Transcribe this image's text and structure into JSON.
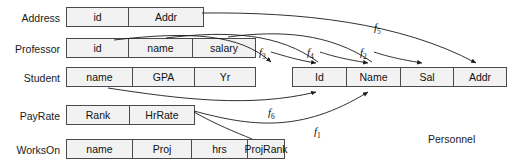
{
  "diagram": {
    "title_caption": "Personnel",
    "source_tables": [
      {
        "name": "Address",
        "label_x": 4,
        "label_y": 13,
        "box_x": 66,
        "box_y": 7,
        "attributes": [
          {
            "name": "id",
            "width": 62
          },
          {
            "name": "Addr",
            "width": 74
          }
        ]
      },
      {
        "name": "Professor",
        "label_x": 4,
        "label_y": 44,
        "box_x": 66,
        "box_y": 38,
        "attributes": [
          {
            "name": "id",
            "width": 62
          },
          {
            "name": "name",
            "width": 64
          },
          {
            "name": "salary",
            "width": 62
          }
        ]
      },
      {
        "name": "Student",
        "label_x": 4,
        "label_y": 73,
        "box_x": 66,
        "box_y": 67,
        "attributes": [
          {
            "name": "name",
            "width": 66
          },
          {
            "name": "GPA",
            "width": 62
          },
          {
            "name": "Yr",
            "width": 60
          }
        ]
      },
      {
        "name": "PayRate",
        "label_x": 4,
        "label_y": 111,
        "box_x": 66,
        "box_y": 105,
        "attributes": [
          {
            "name": "Rank",
            "width": 63
          },
          {
            "name": "HrRate",
            "width": 64
          }
        ]
      },
      {
        "name": "WorksOn",
        "label_x": 4,
        "label_y": 145,
        "box_x": 66,
        "box_y": 139,
        "attributes": [
          {
            "name": "name",
            "width": 66
          },
          {
            "name": "Proj",
            "width": 59
          },
          {
            "name": "hrs",
            "width": 56
          },
          {
            "name": "ProjRank",
            "width": 36
          }
        ]
      }
    ],
    "target_table": {
      "name": "Personnel",
      "box_x": 292,
      "box_y": 67,
      "caption_x": 428,
      "caption_y": 134,
      "attributes": [
        {
          "name": "Id",
          "width": 54
        },
        {
          "name": "Name",
          "width": 54
        },
        {
          "name": "Sal",
          "width": 53
        },
        {
          "name": "Addr",
          "width": 52
        }
      ]
    },
    "mappings": [
      {
        "id": "f5",
        "label": "f",
        "subscript": "5",
        "label_x": 374,
        "label_y": 22,
        "source": "Address.Addr",
        "target": "Personnel.Addr"
      },
      {
        "id": "f3",
        "label": "f",
        "subscript": "3",
        "label_x": 259,
        "label_y": 47,
        "source": "Professor.id",
        "target": "Personnel.Id"
      },
      {
        "id": "f4",
        "label": "f",
        "subscript": "4",
        "label_x": 307,
        "label_y": 47,
        "source": "Professor.name",
        "target": "Personnel.Name"
      },
      {
        "id": "f2",
        "label": "f",
        "subscript": "2",
        "label_x": 360,
        "label_y": 47,
        "source": "Professor.salary",
        "target": "Personnel.Sal"
      },
      {
        "id": "f6",
        "label": "f",
        "subscript": "6",
        "label_x": 268,
        "label_y": 107,
        "source": "Student.name",
        "target": "Personnel.Name"
      },
      {
        "id": "f1",
        "label": "f",
        "subscript": "1",
        "label_x": 314,
        "label_y": 126,
        "source": "PayRate.HrRate",
        "target": "Personnel.Sal"
      }
    ],
    "colors": {
      "box_fill": "#f2f2f2",
      "box_stroke": "#4a4a4a",
      "text": "#111111",
      "arrow": "#1a1a1a",
      "background": "#ffffff"
    }
  }
}
